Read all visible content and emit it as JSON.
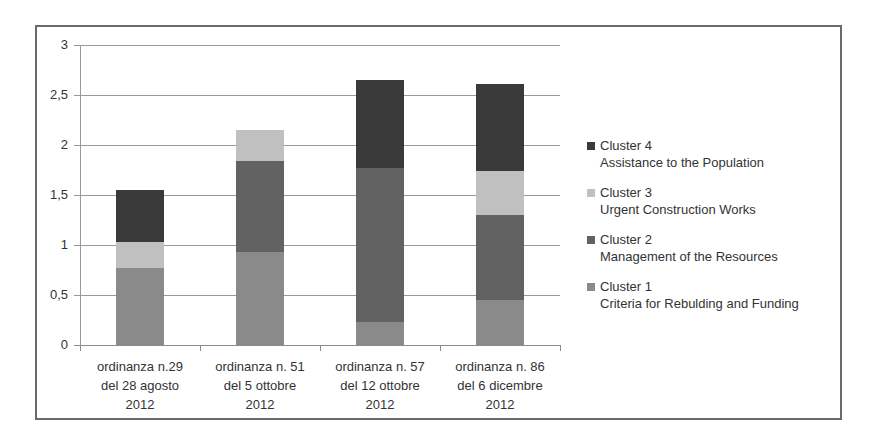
{
  "chart_data": {
    "type": "bar",
    "stacked": true,
    "title": "",
    "xlabel": "",
    "ylabel": "",
    "ylim": [
      0,
      3
    ],
    "yticks": [
      "0",
      "0,5",
      "1",
      "1,5",
      "2",
      "2,5",
      "3"
    ],
    "grid": true,
    "legend_position": "right",
    "categories": [
      [
        "ordinanza n.29",
        "del 28 agosto",
        "2012"
      ],
      [
        "ordinanza n. 51",
        "del 5 ottobre",
        "2012"
      ],
      [
        "ordinanza n. 57",
        "del 12 ottobre",
        "2012"
      ],
      [
        "ordinanza n. 86",
        "del 6 dicembre",
        "2012"
      ]
    ],
    "series": [
      {
        "name": "Cluster 1",
        "description": "Criteria for Rebulding and Funding",
        "color": "#8a8a8a",
        "values": [
          0.77,
          0.93,
          0.23,
          0.45
        ]
      },
      {
        "name": "Cluster 2",
        "description": "Management of the Resources",
        "color": "#626262",
        "values": [
          0,
          0.91,
          1.54,
          0.85
        ]
      },
      {
        "name": "Cluster 3",
        "description": "Urgent Construction Works",
        "color": "#c0c0c0",
        "values": [
          0.26,
          0.31,
          0,
          0.44
        ]
      },
      {
        "name": "Cluster 4",
        "description": "Assistance to the Population",
        "color": "#3a3a3a",
        "values": [
          0.52,
          0,
          0.88,
          0.87
        ]
      }
    ]
  }
}
